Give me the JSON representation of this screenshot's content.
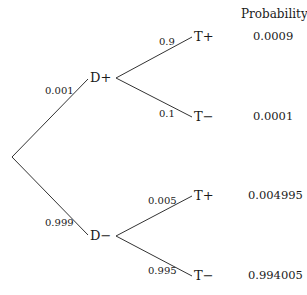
{
  "header": {
    "probability_label": "Probability"
  },
  "nodes": {
    "d_plus": "D+",
    "d_minus": "D−",
    "t_plus_1": "T+",
    "t_minus_1": "T−",
    "t_plus_2": "T+",
    "t_minus_2": "T−"
  },
  "edges": {
    "root_to_d_plus": "0.001",
    "root_to_d_minus": "0.999",
    "d_plus_to_t_plus": "0.9",
    "d_plus_to_t_minus": "0.1",
    "d_minus_to_t_plus": "0.005",
    "d_minus_to_t_minus": "0.995"
  },
  "outcomes": [
    {
      "path": "D+ T+",
      "probability": "0.0009"
    },
    {
      "path": "D+ T−",
      "probability": "0.0001"
    },
    {
      "path": "D− T+",
      "probability": "0.004995"
    },
    {
      "path": "D− T−",
      "probability": "0.994005"
    }
  ],
  "colors": {
    "line": "#333333",
    "text": "#1a1a1a"
  }
}
